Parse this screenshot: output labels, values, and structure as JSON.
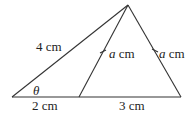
{
  "diagram": {
    "type": "triangle",
    "line_color": "#333333",
    "vertices": {
      "apex": [
        128,
        5
      ],
      "left": [
        12,
        97
      ],
      "mid_base": [
        79,
        97
      ],
      "right": [
        181,
        97
      ]
    },
    "labels": {
      "left_side": "4 cm",
      "angle": "θ",
      "base_left": "2 cm",
      "base_right": "3 cm",
      "inner_side_var": "a",
      "inner_side_unit": " cm",
      "right_side_var": "a",
      "right_side_unit": " cm"
    }
  }
}
